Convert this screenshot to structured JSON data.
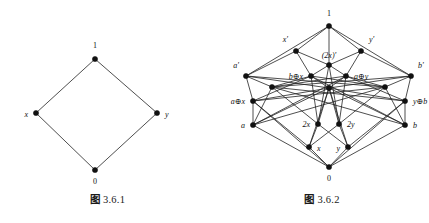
{
  "figures": [
    {
      "id": "figure-361",
      "caption_cjk": "图",
      "caption_number": "3.6.1",
      "diagram": {
        "type": "hasse-diagram",
        "width": 215,
        "height": 186,
        "nodes": [
          {
            "id": "one",
            "label": "1",
            "italic": false,
            "x": 95,
            "y": 59,
            "lx": 95,
            "ly": 48,
            "anchor": "middle"
          },
          {
            "id": "x",
            "label": "x",
            "italic": true,
            "x": 36,
            "y": 113,
            "lx": 28,
            "ly": 117,
            "anchor": "end"
          },
          {
            "id": "y",
            "label": "y",
            "italic": true,
            "x": 157,
            "y": 113,
            "lx": 165,
            "ly": 117,
            "anchor": "start"
          },
          {
            "id": "zero",
            "label": "0",
            "italic": false,
            "x": 95,
            "y": 170,
            "lx": 95,
            "ly": 184,
            "anchor": "middle"
          }
        ],
        "edges": [
          [
            "zero",
            "x"
          ],
          [
            "zero",
            "y"
          ],
          [
            "x",
            "one"
          ],
          [
            "y",
            "one"
          ]
        ]
      }
    },
    {
      "id": "figure-362",
      "caption_cjk": "图",
      "caption_number": "3.6.2",
      "diagram": {
        "type": "hasse-diagram",
        "width": 214,
        "height": 186,
        "nodes": [
          {
            "id": "one",
            "label": "1",
            "italic": false,
            "x": 114,
            "y": 26,
            "lx": 114,
            "ly": 16,
            "anchor": "middle"
          },
          {
            "id": "xp",
            "label": "x'",
            "italic": true,
            "x": 81,
            "y": 51,
            "lx": 73,
            "ly": 42,
            "anchor": "end"
          },
          {
            "id": "twoxp",
            "label": "(2x)'",
            "italic": true,
            "x": 114,
            "y": 65,
            "lx": 114,
            "ly": 58,
            "anchor": "middle"
          },
          {
            "id": "yp",
            "label": "y'",
            "italic": true,
            "x": 146,
            "y": 51,
            "lx": 154,
            "ly": 42,
            "anchor": "start"
          },
          {
            "id": "ap",
            "label": "a'",
            "italic": true,
            "x": 31,
            "y": 76,
            "lx": 24,
            "ly": 68,
            "anchor": "end"
          },
          {
            "id": "bx",
            "label": "b⊕x",
            "italic": true,
            "x": 96,
            "y": 76,
            "lx": 88,
            "ly": 79,
            "anchor": "end"
          },
          {
            "id": "ay",
            "label": "a⊕y",
            "italic": true,
            "x": 131,
            "y": 76,
            "lx": 139,
            "ly": 79,
            "anchor": "start"
          },
          {
            "id": "bp",
            "label": "b'",
            "italic": true,
            "x": 196,
            "y": 76,
            "lx": 203,
            "ly": 68,
            "anchor": "start"
          },
          {
            "id": "m1",
            "label": "",
            "italic": true,
            "x": 57,
            "y": 87,
            "lx": 57,
            "ly": 87,
            "anchor": "middle"
          },
          {
            "id": "m2",
            "label": "",
            "italic": true,
            "x": 114,
            "y": 88,
            "lx": 114,
            "ly": 88,
            "anchor": "middle"
          },
          {
            "id": "m3",
            "label": "",
            "italic": true,
            "x": 170,
            "y": 87,
            "lx": 170,
            "ly": 87,
            "anchor": "middle"
          },
          {
            "id": "ax",
            "label": "a⊕x",
            "italic": true,
            "x": 38,
            "y": 101,
            "lx": 30,
            "ly": 104,
            "anchor": "end"
          },
          {
            "id": "yb",
            "label": "y⊕b",
            "italic": true,
            "x": 190,
            "y": 101,
            "lx": 198,
            "ly": 104,
            "anchor": "start"
          },
          {
            "id": "a",
            "label": "a",
            "italic": true,
            "x": 38,
            "y": 125,
            "lx": 30,
            "ly": 128,
            "anchor": "end"
          },
          {
            "id": "twox",
            "label": "2x",
            "italic": true,
            "x": 103,
            "y": 124,
            "lx": 95,
            "ly": 127,
            "anchor": "end"
          },
          {
            "id": "twoy",
            "label": "2y",
            "italic": true,
            "x": 124,
            "y": 124,
            "lx": 132,
            "ly": 127,
            "anchor": "start"
          },
          {
            "id": "b",
            "label": "b",
            "italic": true,
            "x": 190,
            "y": 125,
            "lx": 198,
            "ly": 128,
            "anchor": "start"
          },
          {
            "id": "x",
            "label": "x",
            "italic": true,
            "x": 94,
            "y": 147,
            "lx": 102,
            "ly": 151,
            "anchor": "start"
          },
          {
            "id": "y",
            "label": "y",
            "italic": true,
            "x": 133,
            "y": 147,
            "lx": 125,
            "ly": 151,
            "anchor": "end"
          },
          {
            "id": "zero",
            "label": "0",
            "italic": false,
            "x": 114,
            "y": 167,
            "lx": 114,
            "ly": 181,
            "anchor": "middle"
          }
        ],
        "edges": [
          [
            "zero",
            "x"
          ],
          [
            "zero",
            "y"
          ],
          [
            "zero",
            "a"
          ],
          [
            "zero",
            "b"
          ],
          [
            "zero",
            "ax"
          ],
          [
            "zero",
            "yb"
          ],
          [
            "x",
            "twox"
          ],
          [
            "x",
            "ax"
          ],
          [
            "x",
            "m2"
          ],
          [
            "x",
            "twoy"
          ],
          [
            "y",
            "twoy"
          ],
          [
            "y",
            "yb"
          ],
          [
            "y",
            "m2"
          ],
          [
            "y",
            "twox"
          ],
          [
            "a",
            "ax"
          ],
          [
            "a",
            "m1"
          ],
          [
            "a",
            "m2"
          ],
          [
            "a",
            "m3"
          ],
          [
            "a",
            "ay"
          ],
          [
            "b",
            "yb"
          ],
          [
            "b",
            "m3"
          ],
          [
            "b",
            "m2"
          ],
          [
            "b",
            "m1"
          ],
          [
            "b",
            "bx"
          ],
          [
            "twox",
            "m1"
          ],
          [
            "twox",
            "m2"
          ],
          [
            "twox",
            "bx"
          ],
          [
            "twox",
            "twoxp"
          ],
          [
            "twoy",
            "m3"
          ],
          [
            "twoy",
            "m2"
          ],
          [
            "twoy",
            "ay"
          ],
          [
            "twoy",
            "twoxp"
          ],
          [
            "ax",
            "ap"
          ],
          [
            "ax",
            "m2"
          ],
          [
            "ax",
            "bx"
          ],
          [
            "ax",
            "m3"
          ],
          [
            "yb",
            "bp"
          ],
          [
            "yb",
            "m2"
          ],
          [
            "yb",
            "ay"
          ],
          [
            "yb",
            "m1"
          ],
          [
            "m1",
            "ap"
          ],
          [
            "m1",
            "bx"
          ],
          [
            "m1",
            "ay"
          ],
          [
            "m1",
            "bp"
          ],
          [
            "m2",
            "bx"
          ],
          [
            "m2",
            "ay"
          ],
          [
            "m2",
            "ap"
          ],
          [
            "m2",
            "bp"
          ],
          [
            "m3",
            "bp"
          ],
          [
            "m3",
            "ay"
          ],
          [
            "m3",
            "bx"
          ],
          [
            "m3",
            "ap"
          ],
          [
            "ap",
            "xp"
          ],
          [
            "ap",
            "one"
          ],
          [
            "bp",
            "yp"
          ],
          [
            "bp",
            "one"
          ],
          [
            "bx",
            "xp"
          ],
          [
            "bx",
            "twoxp"
          ],
          [
            "ay",
            "yp"
          ],
          [
            "ay",
            "twoxp"
          ],
          [
            "xp",
            "one"
          ],
          [
            "yp",
            "one"
          ],
          [
            "twoxp",
            "one"
          ],
          [
            "twoxp",
            "xp"
          ],
          [
            "twoxp",
            "yp"
          ]
        ]
      }
    }
  ]
}
